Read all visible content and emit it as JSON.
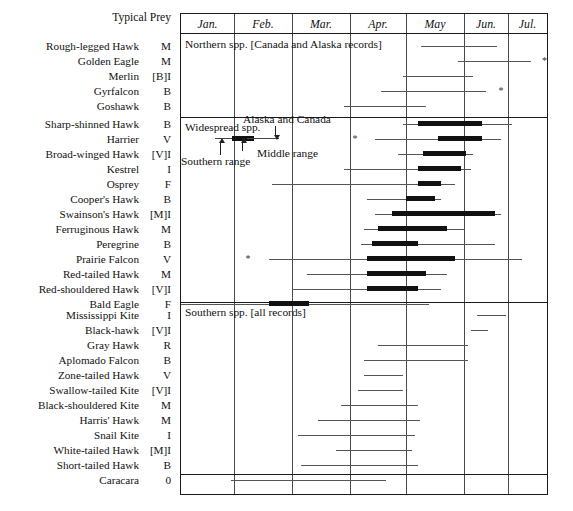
{
  "header": {
    "typical_prey": "Typical Prey"
  },
  "months": [
    {
      "label": "Jan."
    },
    {
      "label": "Feb."
    },
    {
      "label": "Mar."
    },
    {
      "label": "Apr."
    },
    {
      "label": "May"
    },
    {
      "label": "Jun."
    },
    {
      "label": "Jul."
    }
  ],
  "sections": [
    {
      "id": "northern",
      "caption": "Northern spp. [Canada and Alaska records]"
    },
    {
      "id": "widespread",
      "caption": "Widespread spp."
    },
    {
      "id": "southern",
      "caption": "Southern spp. [all records]"
    }
  ],
  "legend": {
    "southern_range": "Southern range",
    "middle_range": "Middle range",
    "alaska_canada": "Alaska and Canada"
  },
  "chart_data": {
    "type": "bar",
    "xlabel": "",
    "ylabel": "",
    "axis": {
      "categories": [
        "Jan.",
        "Feb.",
        "Mar.",
        "Apr.",
        "May",
        "Jun.",
        "Jul."
      ],
      "x_units": "month",
      "xlim": [
        0,
        7
      ],
      "grid": true,
      "legend_position": "inside-upper-left"
    },
    "encoding": {
      "thin_line": "southern range / full extent of records",
      "thick_bar": "middle range (peak passage)",
      "asterisk": "extreme or isolated record",
      "prey_codes": [
        "M = mammals",
        "B = birds",
        "I = insects",
        "V = varied",
        "F = fish",
        "R = reptiles",
        "0 = carrion"
      ]
    },
    "series": [
      {
        "group": "Northern spp. [Canada and Alaska records]",
        "rows": [
          {
            "species": "Rough-legged Hawk",
            "prey": "M",
            "thin": [
              4.25,
              5.75
            ],
            "thick": null,
            "asterisk": null
          },
          {
            "species": "Golden Eagle",
            "prey": "M",
            "thin": [
              4.9,
              6.6
            ],
            "thick": null,
            "asterisk": 6.95
          },
          {
            "species": "Merlin",
            "prey": "[B]I",
            "thin": [
              3.95,
              5.2
            ],
            "thick": null,
            "asterisk": null
          },
          {
            "species": "Gyrfalcon",
            "prey": "B",
            "thin": [
              3.55,
              5.5
            ],
            "thick": null,
            "asterisk": 5.85
          },
          {
            "species": "Goshawk",
            "prey": "B",
            "thin": [
              2.9,
              4.35
            ],
            "thick": null,
            "asterisk": null
          }
        ]
      },
      {
        "group": "Widespread spp.",
        "rows": [
          {
            "species": "Sharp-shinned Hawk",
            "prey": "B",
            "thin": [
              3.95,
              6.1
            ],
            "thick": [
              4.2,
              5.4
            ],
            "asterisk": null
          },
          {
            "species": "Harrier",
            "prey": "V",
            "thin": [
              3.45,
              5.85
            ],
            "thick": [
              4.55,
              5.4
            ],
            "asterisk": 3.1
          },
          {
            "species": "Broad-winged Hawk",
            "prey": "[V]I",
            "thin": [
              3.85,
              5.2
            ],
            "thick": [
              4.3,
              5.05
            ],
            "asterisk": null
          },
          {
            "species": "Kestrel",
            "prey": "I",
            "thin": [
              2.9,
              5.15
            ],
            "thick": [
              4.2,
              4.95
            ],
            "asterisk": null
          },
          {
            "species": "Osprey",
            "prey": "F",
            "thin": [
              1.65,
              4.85
            ],
            "thick": [
              4.2,
              4.6
            ],
            "asterisk": null
          },
          {
            "species": "Cooper's Hawk",
            "prey": "B",
            "thin": [
              3.3,
              4.6
            ],
            "thick": [
              4.0,
              4.5
            ],
            "asterisk": null
          },
          {
            "species": "Swainson's Hawk",
            "prey": "[M]I",
            "thin": [
              3.45,
              5.85
            ],
            "thick": [
              3.75,
              5.7
            ],
            "asterisk": null
          },
          {
            "species": "Ferruginous Hawk",
            "prey": "M",
            "thin": [
              3.25,
              5.0
            ],
            "thick": [
              3.5,
              4.7
            ],
            "asterisk": null
          },
          {
            "species": "Peregrine",
            "prey": "B",
            "thin": [
              3.2,
              5.7
            ],
            "thick": [
              3.4,
              4.2
            ],
            "asterisk": null
          },
          {
            "species": "Prairie Falcon",
            "prey": "V",
            "thin": [
              1.6,
              6.35
            ],
            "thick": [
              3.3,
              4.85
            ],
            "asterisk": 1.25
          },
          {
            "species": "Red-tailed Hawk",
            "prey": "M",
            "thin": [
              2.25,
              4.7
            ],
            "thick": [
              3.3,
              4.35
            ],
            "asterisk": null
          },
          {
            "species": "Red-shouldered Hawk",
            "prey": "[V]I",
            "thin": [
              2.0,
              4.6
            ],
            "thick": [
              3.3,
              4.2
            ],
            "asterisk": null
          },
          {
            "species": "Bald Eagle",
            "prey": "F",
            "thin": [
              0.0,
              4.4
            ],
            "thick": [
              1.6,
              2.3
            ],
            "asterisk": null
          }
        ]
      },
      {
        "group": "Southern spp. [all records]",
        "rows": [
          {
            "species": "Mississippi Kite",
            "prey": "I",
            "thin": [
              5.3,
              5.95
            ],
            "thick": null,
            "asterisk": null
          },
          {
            "species": "Black-hawk",
            "prey": "[V]I",
            "thin": [
              5.15,
              5.55
            ],
            "thick": null,
            "asterisk": null
          },
          {
            "species": "Gray Hawk",
            "prey": "R",
            "thin": [
              3.5,
              5.1
            ],
            "thick": null,
            "asterisk": null
          },
          {
            "species": "Aplomado Falcon",
            "prey": "B",
            "thin": [
              3.25,
              5.1
            ],
            "thick": null,
            "asterisk": null
          },
          {
            "species": "Zone-tailed Hawk",
            "prey": "V",
            "thin": [
              3.25,
              3.95
            ],
            "thick": null,
            "asterisk": null
          },
          {
            "species": "Swallow-tailed Kite",
            "prey": "[V]I",
            "thin": [
              3.15,
              3.95
            ],
            "thick": null,
            "asterisk": null
          },
          {
            "species": "Black-shouldered Kite",
            "prey": "M",
            "thin": [
              2.85,
              4.2
            ],
            "thick": null,
            "asterisk": null
          },
          {
            "species": "Harris' Hawk",
            "prey": "M",
            "thin": [
              2.45,
              4.25
            ],
            "thick": null,
            "asterisk": null
          },
          {
            "species": "Snail Kite",
            "prey": "I",
            "thin": [
              2.1,
              4.15
            ],
            "thick": null,
            "asterisk": null
          },
          {
            "species": "White-tailed Hawk",
            "prey": "[M]I",
            "thin": [
              2.75,
              4.1
            ],
            "thick": null,
            "asterisk": null
          },
          {
            "species": "Short-tailed Hawk",
            "prey": "B",
            "thin": [
              2.15,
              4.2
            ],
            "thick": null,
            "asterisk": null
          },
          {
            "species": "Caracara",
            "prey": "0",
            "thin": [
              0.95,
              3.65
            ],
            "thick": null,
            "asterisk": null
          }
        ]
      }
    ]
  }
}
